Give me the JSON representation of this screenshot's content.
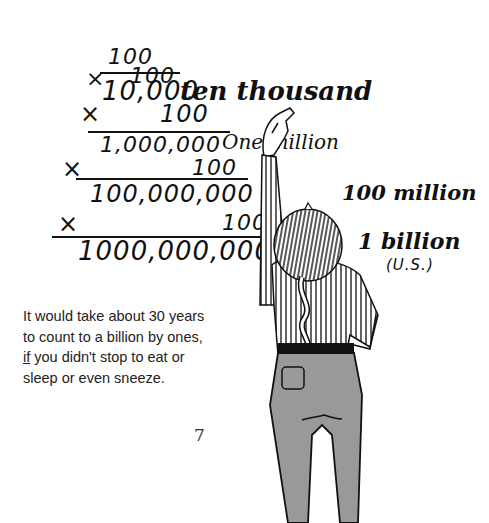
{
  "multiplication": {
    "start": "100",
    "steps": [
      {
        "operator": "×",
        "multiplier": "100",
        "result": "10,000",
        "label": "ten thousand"
      },
      {
        "operator": "×",
        "multiplier": "100",
        "result": "1,000,000",
        "label": "One million"
      },
      {
        "operator": "×",
        "multiplier": "100",
        "result": "100,000,000",
        "label": "100 million"
      },
      {
        "operator": "×",
        "multiplier": "100",
        "result": "1000,000,000",
        "label": "1 billion",
        "sublabel": "(U.S.)"
      }
    ]
  },
  "caption": {
    "line1": "It would take about 30 years",
    "line2": "to count to a billion by ones,",
    "line3_emph": "if",
    "line3_rest": " you didn't stop to eat or",
    "line4": "sleep or even sneeze."
  },
  "page_number": "7",
  "illustration": {
    "subject": "girl with braid writing on board",
    "colors": {
      "ink": "#111111",
      "pants": "#999999",
      "paper": "#ffffff"
    }
  }
}
